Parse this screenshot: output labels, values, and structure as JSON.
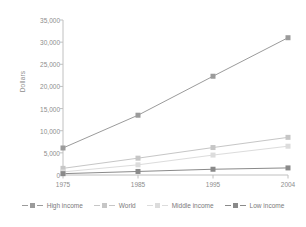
{
  "chart_data": {
    "type": "line",
    "title": "",
    "xlabel": "",
    "ylabel": "Dollars",
    "categories": [
      "1975",
      "1985",
      "1995",
      "2004"
    ],
    "x": [
      1975,
      1985,
      1995,
      2004
    ],
    "xlim": [
      1975,
      2004
    ],
    "ylim": [
      0,
      35000
    ],
    "yticks": [
      0,
      5000,
      10000,
      15000,
      20000,
      25000,
      30000,
      35000
    ],
    "ytick_labels": [
      "0",
      "5,000",
      "10,000",
      "15,000",
      "20,000",
      "25,000",
      "30,000",
      "35,000"
    ],
    "xticks": [
      1975,
      1985,
      1995,
      2004
    ],
    "xtick_labels": [
      "1975",
      "1985",
      "1995",
      "2004"
    ],
    "grid": false,
    "legend_position": "bottom",
    "marker": "square",
    "series": [
      {
        "name": "High income",
        "color": "#9b9b9b",
        "values": [
          6100,
          13500,
          22300,
          31000
        ]
      },
      {
        "name": "World",
        "color": "#c6c6c6",
        "values": [
          1500,
          3800,
          6200,
          8500
        ]
      },
      {
        "name": "Middle income",
        "color": "#dcdcdc",
        "values": [
          700,
          2300,
          4500,
          6500
        ]
      },
      {
        "name": "Low income",
        "color": "#8a8a8a",
        "values": [
          300,
          800,
          1300,
          1600
        ]
      }
    ]
  },
  "axis": {
    "line_color": "#c0c0c0",
    "tick_color": "#c0c0c0",
    "label_color": "#8d8d8d"
  },
  "legend": {
    "items": [
      {
        "label": "High income",
        "color": "#9b9b9b"
      },
      {
        "label": "World",
        "color": "#c6c6c6"
      },
      {
        "label": "Middle income",
        "color": "#dcdcdc"
      },
      {
        "label": "Low income",
        "color": "#8a8a8a"
      }
    ]
  }
}
